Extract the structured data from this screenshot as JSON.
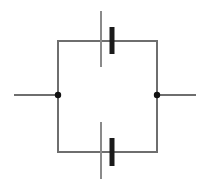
{
  "diagram": {
    "type": "electrical-schematic",
    "canvas": {
      "width": 207,
      "height": 189,
      "background": "#ffffff"
    },
    "colors": {
      "wire": "#6e6e6e",
      "plate_thin": "#8a8a8a",
      "plate_thick": "#1a1a1a",
      "node": "#111111",
      "background": "#ffffff"
    },
    "stroke_widths": {
      "wire": 2,
      "plate_thin": 2,
      "plate_thick": 5,
      "node_radius": 3.2
    },
    "loop": {
      "label": "parallel loop",
      "left_x": 58,
      "right_x": 157,
      "top_y": 41,
      "bottom_y": 152
    },
    "components": [
      {
        "id": "capacitor-top",
        "label": "C1",
        "kind": "capacitor",
        "orientation": "vertical-plates-on-horizontal-wire",
        "branch": "top",
        "wire_y": 41,
        "plate_thin": {
          "x": 101,
          "y1": 11,
          "y2": 67
        },
        "plate_thick": {
          "x": 112,
          "y1": 27,
          "y2": 54
        }
      },
      {
        "id": "capacitor-bottom",
        "label": "C2",
        "kind": "capacitor",
        "orientation": "vertical-plates-on-horizontal-wire",
        "branch": "bottom",
        "wire_y": 152,
        "plate_thin": {
          "x": 101,
          "y1": 122,
          "y2": 179
        },
        "plate_thick": {
          "x": 112,
          "y1": 138,
          "y2": 166
        }
      }
    ],
    "terminals": [
      {
        "id": "terminal-left",
        "label": "Left terminal",
        "lead": {
          "x1": 14,
          "x2": 58,
          "y": 95
        },
        "node": {
          "cx": 58,
          "cy": 95
        }
      },
      {
        "id": "terminal-right",
        "label": "Right terminal",
        "lead": {
          "x1": 157,
          "x2": 196,
          "y": 95
        },
        "node": {
          "cx": 157,
          "cy": 95
        }
      }
    ],
    "wires": [
      {
        "id": "wire-top-rail",
        "label": "top rail",
        "x1": 58,
        "y1": 41,
        "x2": 157,
        "y2": 41
      },
      {
        "id": "wire-bottom-rail",
        "label": "bottom rail",
        "x1": 58,
        "y1": 152,
        "x2": 157,
        "y2": 152
      },
      {
        "id": "wire-left-rail",
        "label": "left rail",
        "x1": 58,
        "y1": 41,
        "x2": 58,
        "y2": 152
      },
      {
        "id": "wire-right-rail",
        "label": "right rail",
        "x1": 157,
        "y1": 41,
        "x2": 157,
        "y2": 152
      }
    ]
  }
}
